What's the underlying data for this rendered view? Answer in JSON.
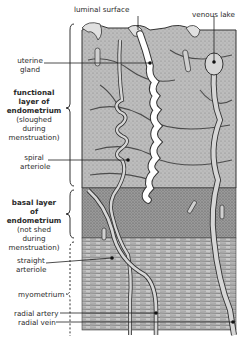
{
  "figure": {
    "top_labels": {
      "luminal_surface": "luminal surface",
      "venous_lake": "venous lake"
    },
    "left_labels": {
      "uterine_gland": [
        "uterine",
        "gland"
      ],
      "functional_layer": {
        "title": [
          "functional",
          "layer of",
          "endometrium"
        ],
        "note": [
          "(sloughed",
          "during",
          "menstruation)"
        ]
      },
      "spiral_arteriole": [
        "spiral",
        "arteriole"
      ],
      "basal_layer": {
        "title": [
          "basal layer",
          "of",
          "endometrium"
        ],
        "note": [
          "(not shed",
          "during",
          "menstruation)"
        ]
      },
      "straight_arteriole": [
        "straight",
        "arteriole"
      ],
      "myometrium": "myometrium",
      "radial_artery": "radial artery",
      "radial_vein": "radial vein"
    },
    "colors": {
      "tissue_functional": "#b9b9b9",
      "tissue_basal": "#8f8f8f",
      "myometrium": "#a8a8a8",
      "vessel_fill": "#d6d6d6",
      "gland_lumen": "#ffffff",
      "outline": "#333333"
    }
  }
}
